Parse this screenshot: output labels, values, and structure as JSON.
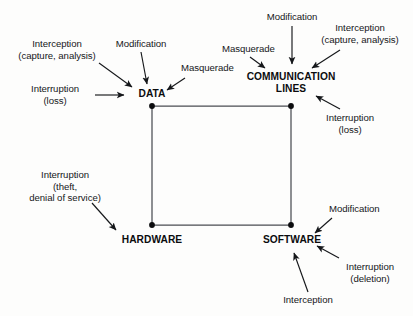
{
  "figure": {
    "kind": "security-threat-diagram",
    "background_color": "#fdfdfc",
    "line_color": "#4a4d52",
    "arrow_color": "#15171a",
    "text_color": "#15171a",
    "node_text_color": "#0b0c0e"
  },
  "nodes": [
    {
      "id": "data",
      "label": "DATA",
      "lines": [
        "DATA"
      ],
      "x": 152,
      "y": 106
    },
    {
      "id": "comm",
      "label": "COMMUNICATION LINES",
      "lines": [
        "COMMUNICATION",
        "LINES"
      ],
      "x": 291,
      "y": 106
    },
    {
      "id": "hardware",
      "label": "HARDWARE",
      "lines": [
        "HARDWARE"
      ],
      "x": 152,
      "y": 225
    },
    {
      "id": "software",
      "label": "SOFTWARE",
      "lines": [
        "SOFTWARE"
      ],
      "x": 291,
      "y": 225
    }
  ],
  "edges": [
    {
      "from": "data",
      "to": "comm"
    },
    {
      "from": "comm",
      "to": "software"
    },
    {
      "from": "software",
      "to": "hardware"
    },
    {
      "from": "hardware",
      "to": "data"
    }
  ],
  "threats": {
    "data": [
      {
        "id": "data-interception",
        "lines": [
          "Interception",
          "(capture, analysis)"
        ]
      },
      {
        "id": "data-modification",
        "lines": [
          "Modification"
        ]
      },
      {
        "id": "data-masquerade",
        "lines": [
          "Masquerade"
        ]
      },
      {
        "id": "data-interruption",
        "lines": [
          "Interruption",
          "(loss)"
        ]
      }
    ],
    "comm": [
      {
        "id": "comm-modification",
        "lines": [
          "Modification"
        ]
      },
      {
        "id": "comm-interception",
        "lines": [
          "Interception",
          "(capture, analysis)"
        ]
      },
      {
        "id": "comm-masquerade",
        "lines": [
          "Masquerade"
        ]
      },
      {
        "id": "comm-interruption",
        "lines": [
          "Interruption",
          "(loss)"
        ]
      }
    ],
    "hardware": [
      {
        "id": "hardware-interruption",
        "lines": [
          "Interruption",
          "(theft,",
          "denial of service)"
        ]
      }
    ],
    "software": [
      {
        "id": "software-modification",
        "lines": [
          "Modification"
        ]
      },
      {
        "id": "software-interruption",
        "lines": [
          "Interruption",
          "(deletion)"
        ]
      },
      {
        "id": "software-interception",
        "lines": [
          "Interception"
        ]
      }
    ]
  },
  "labels": {
    "data_interception": "Interception\n(capture, analysis)",
    "data_modification": "Modification",
    "data_masquerade": "Masquerade",
    "data_interruption": "Interruption\n(loss)",
    "data_node": "DATA",
    "comm_modification": "Modification",
    "comm_interception": "Interception\n(capture, analysis)",
    "comm_masquerade": "Masquerade",
    "comm_interruption": "Interruption\n(loss)",
    "comm_node_line1": "COMMUNICATION",
    "comm_node_line2": "LINES",
    "hardware_interruption": "Interruption\n(theft,\ndenial of service)",
    "hardware_node": "HARDWARE",
    "software_modification": "Modification",
    "software_interruption": "Interruption\n(deletion)",
    "software_interception": "Interception",
    "software_node": "SOFTWARE"
  }
}
